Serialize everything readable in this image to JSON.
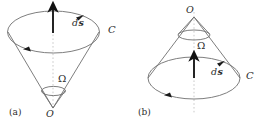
{
  "figure": {
    "name": "solid-angle-cone-figure",
    "width": 257,
    "height": 121,
    "line_color": "#6b6b6b",
    "dash_color": "#bdbdbd",
    "arrow_color": "#1a1a1a",
    "text_color": "#2b2b2b",
    "panels": [
      {
        "id": "a",
        "caption": "(a)",
        "labels": {
          "vertex": "O",
          "solid_angle": "Ω",
          "curve": "C",
          "surface_element": "ds"
        }
      },
      {
        "id": "b",
        "caption": "(b)",
        "labels": {
          "vertex": "O",
          "solid_angle": "Ω",
          "curve": "C",
          "surface_element": "ds"
        }
      }
    ]
  }
}
